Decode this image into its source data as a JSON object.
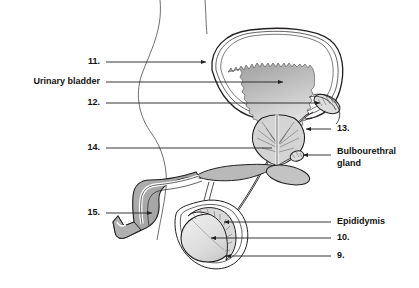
{
  "figure": {
    "background_color": "#ffffff",
    "line_color": "#231f20",
    "fill_light": "#e8e8e8",
    "fill_mid": "#c9c9c9",
    "fill_dark": "#a8a8a8"
  },
  "labels": {
    "left": [
      {
        "id": "label-11",
        "text": "11.",
        "x": 100,
        "y": 62
      },
      {
        "id": "label-urinary-bladder",
        "text": "Urinary bladder",
        "x": 100,
        "y": 82
      },
      {
        "id": "label-12",
        "text": "12.",
        "x": 100,
        "y": 103
      },
      {
        "id": "label-14",
        "text": "14.",
        "x": 100,
        "y": 148
      },
      {
        "id": "label-15",
        "text": "15.",
        "x": 100,
        "y": 213
      }
    ],
    "right": [
      {
        "id": "label-13",
        "text": "13.",
        "x": 337,
        "y": 129
      },
      {
        "id": "label-bulbourethral-line1",
        "text": "Bulbourethral",
        "x": 337,
        "y": 152
      },
      {
        "id": "label-bulbourethral-line2",
        "text": "gland",
        "x": 337,
        "y": 164
      },
      {
        "id": "label-epididymis",
        "text": "Epididymis",
        "x": 337,
        "y": 222
      },
      {
        "id": "label-10",
        "text": "10.",
        "x": 337,
        "y": 238
      },
      {
        "id": "label-9",
        "text": "9.",
        "x": 337,
        "y": 256
      }
    ]
  },
  "anatomy": {
    "parts": [
      "urinary bladder",
      "seminal vesicle",
      "prostate gland",
      "bulbourethral gland",
      "penis shaft",
      "glans penis",
      "urethra",
      "testis",
      "epididymis",
      "scrotum",
      "ductus deferens"
    ]
  }
}
